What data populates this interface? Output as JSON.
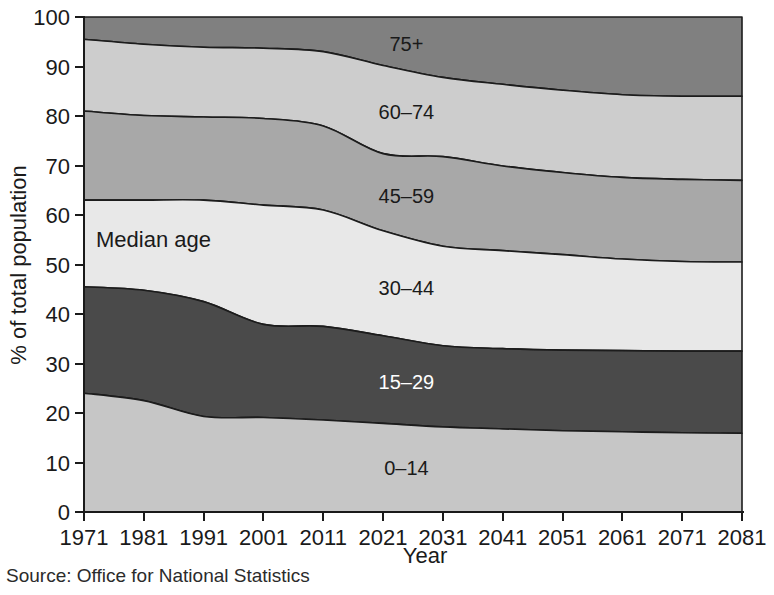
{
  "chart_data": {
    "type": "area",
    "title": "",
    "subtitle": "",
    "xlabel": "Year",
    "ylabel": "% of total population",
    "xlim": [
      1971,
      2081
    ],
    "ylim": [
      0,
      100
    ],
    "grid": false,
    "legend_position": "inline-band-labels",
    "stacked": true,
    "x": [
      1971,
      1981,
      1991,
      2001,
      2011,
      2021,
      2031,
      2041,
      2051,
      2061,
      2071,
      2081
    ],
    "xtick_labels": [
      "1971",
      "1981",
      "1991",
      "2001",
      "2011",
      "2021",
      "2031",
      "2041",
      "2051",
      "2061",
      "2071",
      "2081"
    ],
    "ytick_labels": [
      "0",
      "10",
      "20",
      "30",
      "40",
      "50",
      "60",
      "70",
      "80",
      "90",
      "100"
    ],
    "ytick_values": [
      0,
      10,
      20,
      30,
      40,
      50,
      60,
      70,
      80,
      90,
      100
    ],
    "series": [
      {
        "name": "0–14",
        "label": "0–14",
        "color": "#c6c6c6",
        "label_color": "#1a1a1a",
        "values": [
          24.0,
          22.5,
          19.3,
          19.1,
          18.6,
          17.9,
          17.2,
          16.8,
          16.4,
          16.2,
          16.0,
          15.9
        ],
        "cumulative": [
          24.0,
          22.5,
          19.3,
          19.1,
          18.6,
          17.9,
          17.2,
          16.8,
          16.4,
          16.2,
          16.0,
          15.9
        ]
      },
      {
        "name": "15–29",
        "label": "15–29",
        "color": "#4a4a4a",
        "label_color": "#ffffff",
        "values": [
          21.5,
          22.3,
          23.2,
          18.8,
          18.9,
          17.7,
          16.4,
          16.2,
          16.3,
          16.4,
          16.5,
          16.6
        ],
        "cumulative": [
          45.5,
          44.8,
          42.5,
          37.9,
          37.5,
          35.6,
          33.6,
          33.0,
          32.7,
          32.6,
          32.5,
          32.5
        ]
      },
      {
        "name": "30–44",
        "label": "30–44",
        "color": "#e8e8e8",
        "label_color": "#1a1a1a",
        "values": [
          17.5,
          18.2,
          20.5,
          24.1,
          23.5,
          21.2,
          20.1,
          19.8,
          19.3,
          18.5,
          18.1,
          18.0
        ],
        "cumulative": [
          63.0,
          63.0,
          63.0,
          62.0,
          61.0,
          56.8,
          53.7,
          52.8,
          52.0,
          51.1,
          50.6,
          50.5
        ]
      },
      {
        "name": "45–59",
        "label": "45–59",
        "color": "#a8a8a8",
        "label_color": "#1a1a1a",
        "values": [
          18.0,
          17.1,
          16.8,
          17.5,
          17.0,
          15.6,
          18.1,
          17.1,
          16.6,
          16.5,
          16.6,
          16.5
        ],
        "cumulative": [
          81.0,
          80.1,
          79.8,
          79.5,
          78.0,
          72.4,
          71.8,
          69.9,
          68.6,
          67.6,
          67.2,
          67.0
        ]
      },
      {
        "name": "60–74",
        "label": "60–74",
        "color": "#cdcdcd",
        "label_color": "#1a1a1a",
        "values": [
          14.5,
          14.4,
          14.1,
          14.2,
          15.0,
          17.8,
          16.0,
          16.5,
          16.6,
          16.7,
          16.8,
          17.0
        ],
        "cumulative": [
          95.5,
          94.5,
          93.9,
          93.7,
          93.0,
          90.2,
          87.8,
          86.4,
          85.2,
          84.3,
          84.0,
          84.0
        ]
      },
      {
        "name": "75+",
        "label": "75+",
        "color": "#808080",
        "label_color": "#1a1a1a",
        "values": [
          4.5,
          5.5,
          6.1,
          6.3,
          7.0,
          9.8,
          12.2,
          13.6,
          14.8,
          15.7,
          16.0,
          16.0
        ],
        "cumulative": [
          100,
          100,
          100,
          100,
          100,
          100,
          100,
          100,
          100,
          100,
          100,
          100
        ]
      }
    ],
    "annotations": [
      {
        "text": "Median age",
        "x_px": 96,
        "y_value": 55
      }
    ]
  },
  "figure": {
    "source_note": "Source: Office for National Statistics"
  }
}
